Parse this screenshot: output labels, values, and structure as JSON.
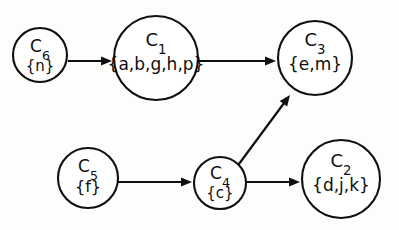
{
  "diagram": {
    "background_color": "#fdfdfc",
    "stroke_color": "#100f0d",
    "node_fill": "#ffffff",
    "nodes": [
      {
        "key": "c6",
        "id_letter": "C",
        "id_sub": "6",
        "set_label": "{n}",
        "cx": 40,
        "cy": 55,
        "r": 27,
        "id_font_size": 17,
        "set_font_size": 15,
        "id_dy": -3,
        "set_dy": 16
      },
      {
        "key": "c1",
        "id_letter": "C",
        "id_sub": "1",
        "set_label": "{a,b,g,h,p}",
        "cx": 156,
        "cy": 58,
        "r": 42,
        "id_font_size": 18,
        "set_font_size": 17,
        "id_dy": -12,
        "set_dy": 12
      },
      {
        "key": "c3",
        "id_letter": "C",
        "id_sub": "3",
        "set_label": "{e,m}",
        "cx": 315,
        "cy": 58,
        "r": 37,
        "id_font_size": 18,
        "set_font_size": 17,
        "id_dy": -12,
        "set_dy": 12
      },
      {
        "key": "c5",
        "id_letter": "C",
        "id_sub": "5",
        "set_label": "{f}",
        "cx": 88,
        "cy": 178,
        "r": 30,
        "id_font_size": 17,
        "set_font_size": 16,
        "id_dy": -6,
        "set_dy": 14
      },
      {
        "key": "c4",
        "id_letter": "C",
        "id_sub": "4",
        "set_label": "{c}",
        "cx": 220,
        "cy": 183,
        "r": 26,
        "id_font_size": 17,
        "set_font_size": 15,
        "id_dy": -4,
        "set_dy": 15
      },
      {
        "key": "c2",
        "id_letter": "C",
        "id_sub": "2",
        "set_label": "{d,j,k}",
        "cx": 341,
        "cy": 179,
        "r": 39,
        "id_font_size": 18,
        "set_font_size": 17,
        "id_dy": -12,
        "set_dy": 12
      }
    ],
    "edges": [
      {
        "key": "c6-c1",
        "from": "c6",
        "to": "c1",
        "x1": 68,
        "y1": 61,
        "x2": 112,
        "y2": 61
      },
      {
        "key": "c1-c3",
        "from": "c1",
        "to": "c3",
        "x1": 198,
        "y1": 61,
        "x2": 276,
        "y2": 61
      },
      {
        "key": "c5-c4",
        "from": "c5",
        "to": "c4",
        "x1": 118,
        "y1": 182,
        "x2": 192,
        "y2": 182
      },
      {
        "key": "c4-c2",
        "from": "c4",
        "to": "c2",
        "x1": 246,
        "y1": 182,
        "x2": 300,
        "y2": 182
      },
      {
        "key": "c4-c3",
        "from": "c4",
        "to": "c3",
        "x1": 236,
        "y1": 168,
        "x2": 290,
        "y2": 95
      }
    ]
  }
}
